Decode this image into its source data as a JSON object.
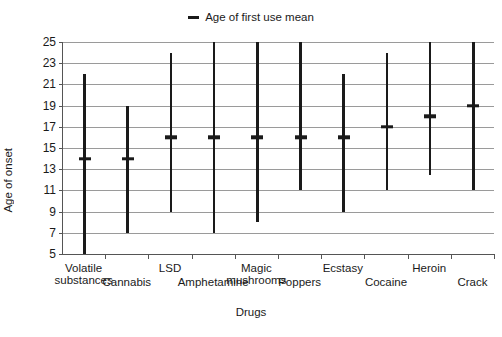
{
  "chart_data": {
    "type": "bar",
    "title": "",
    "xlabel": "Drugs",
    "ylabel": "Age of onset",
    "ylim": [
      5,
      25
    ],
    "ytick_step": 2,
    "yticks": [
      25,
      23,
      21,
      19,
      17,
      15,
      13,
      11,
      9,
      7,
      5
    ],
    "grid": true,
    "legend": {
      "position": "top-center",
      "entries": [
        {
          "label": "Age of first use mean",
          "marker": "dash",
          "color": "#1a1a1a"
        }
      ]
    },
    "categories": [
      "Volatile substances",
      "Cannabis",
      "LSD",
      "Amphetamine",
      "Magic mushrooms",
      "Poppers",
      "Ecstasy",
      "Cocaine",
      "Heroin",
      "Crack"
    ],
    "series": [
      {
        "name": "Age of first use range",
        "kind": "range",
        "low": [
          5.0,
          7.0,
          9.0,
          7.0,
          8.0,
          11.0,
          9.0,
          11.0,
          12.5,
          11.0
        ],
        "high": [
          22.0,
          19.0,
          24.0,
          25.0,
          25.0,
          25.0,
          22.0,
          24.0,
          25.0,
          25.0
        ]
      },
      {
        "name": "Age of first use mean",
        "kind": "marker",
        "values": [
          14.0,
          14.0,
          16.0,
          16.0,
          16.0,
          16.0,
          16.0,
          17.0,
          18.0,
          19.0
        ]
      }
    ],
    "label_rows": [
      1,
      0,
      1,
      0,
      1,
      0,
      1,
      0,
      1,
      0
    ]
  },
  "colors": {
    "series": "#1a1a1a",
    "grid": "#9a9a9a",
    "axis": "#555555",
    "background": "#ffffff"
  }
}
